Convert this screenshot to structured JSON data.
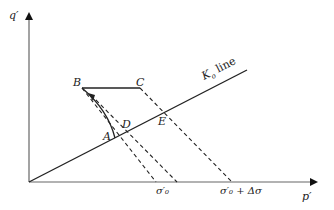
{
  "diagram": {
    "type": "stress-path",
    "axes": {
      "x_label": "p′",
      "y_label": "q′"
    },
    "k0_line": {
      "label_main": "K",
      "label_sub": "o",
      "label_rest": " line"
    },
    "points": {
      "A": "A",
      "B": "B",
      "C": "C",
      "D": "D",
      "E": "E"
    },
    "x_ticks": {
      "sigma0": "σ′₀",
      "sigma0_plus": "σ′₀ + Δσ"
    },
    "colors": {
      "line": "#222222",
      "axis": "#555555",
      "background": "#ffffff"
    }
  }
}
